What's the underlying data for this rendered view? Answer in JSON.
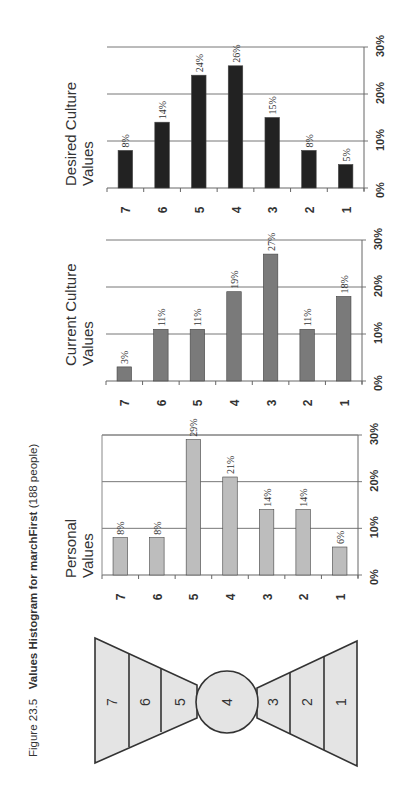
{
  "caption": {
    "figure_number": "Figure 23.5",
    "title": "Values Histogram for marchFirst",
    "subtitle": "(188 people)"
  },
  "chart_data": [
    {
      "type": "bar",
      "title": "Desired Culture Values",
      "title_lines": [
        "Desired Culture",
        "Values"
      ],
      "categories": [
        "7",
        "6",
        "5",
        "4",
        "3",
        "2",
        "1"
      ],
      "values": [
        8,
        14,
        24,
        26,
        15,
        8,
        5
      ],
      "value_labels": [
        "8%",
        "14%",
        "24%",
        "26%",
        "15%",
        "8%",
        "5%"
      ],
      "ylabel": "",
      "xlabel": "",
      "ylim": [
        0,
        30
      ],
      "yticks": [
        "0%",
        "10%",
        "20%",
        "30%"
      ],
      "grid": true,
      "bar_color": "#222222"
    },
    {
      "type": "bar",
      "title": "Current Culture Values",
      "title_lines": [
        "Current Culture",
        "Values"
      ],
      "categories": [
        "7",
        "6",
        "5",
        "4",
        "3",
        "2",
        "1"
      ],
      "values": [
        3,
        11,
        11,
        19,
        27,
        11,
        18
      ],
      "value_labels": [
        "3%",
        "11%",
        "11%",
        "19%",
        "27%",
        "11%",
        "18%"
      ],
      "ylabel": "",
      "xlabel": "",
      "ylim": [
        0,
        30
      ],
      "yticks": [
        "0%",
        "10%",
        "20%",
        "30%"
      ],
      "grid": true,
      "bar_color": "#7a7a7a"
    },
    {
      "type": "bar",
      "title": "Personal Values",
      "title_lines": [
        "Personal",
        "Values"
      ],
      "categories": [
        "7",
        "6",
        "5",
        "4",
        "3",
        "2",
        "1"
      ],
      "values": [
        8,
        8,
        29,
        21,
        14,
        14,
        6
      ],
      "value_labels": [
        "8%",
        "8%",
        "29%",
        "21%",
        "14%",
        "14%",
        "6%"
      ],
      "ylabel": "",
      "xlabel": "",
      "ylim": [
        0,
        30
      ],
      "yticks": [
        "0%",
        "10%",
        "20%",
        "30%"
      ],
      "grid": true,
      "bar_color": "#bdbdbd"
    }
  ],
  "bowtie": {
    "levels": [
      "7",
      "6",
      "5",
      "4",
      "3",
      "2",
      "1"
    ]
  }
}
